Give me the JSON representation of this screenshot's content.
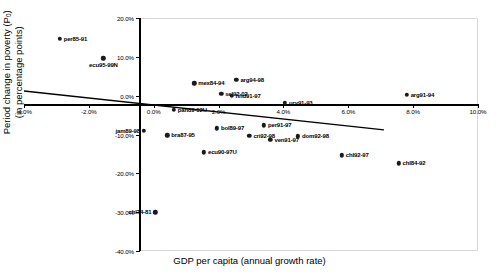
{
  "chart_data": {
    "type": "scatter",
    "title": "",
    "xlabel": "GDP per capita (annual growth rate)",
    "ylabel_line1": "Period change in poverty (P",
    "ylabel_sub": "0",
    "ylabel_line1_end": ")",
    "ylabel_line2": "(in percentage points)",
    "xlim": [
      -4.0,
      10.0
    ],
    "ylim": [
      -40.0,
      20.0
    ],
    "xticks": [
      "-4.0%",
      "-2.0%",
      "0.0%",
      "2.0%",
      "4.0%",
      "6.0%",
      "8.0%",
      "10.0%"
    ],
    "xtick_values": [
      -4.0,
      -2.0,
      0.0,
      2.0,
      4.0,
      6.0,
      8.0,
      10.0
    ],
    "yticks": [
      "20.0%",
      "10.0%",
      "0.0%",
      "-10.0%",
      "-20.0%",
      "-30.0%",
      "-40.0%"
    ],
    "ytick_values": [
      20.0,
      10.0,
      0.0,
      -10.0,
      -20.0,
      -30.0,
      -40.0
    ],
    "grid": false,
    "legend": "none",
    "trendline": {
      "label": "linear fit",
      "x0": -4.0,
      "y0": 1.2,
      "x1": 7.1,
      "y1": -8.8
    },
    "points": [
      {
        "label": "per85-91",
        "x": -2.9,
        "y": 14.6,
        "pos": "right"
      },
      {
        "label": "ecu95-99N",
        "x": -1.55,
        "y": 9.6,
        "pos": "below"
      },
      {
        "label": "mex84-94",
        "x": 1.25,
        "y": 3.2,
        "pos": "right"
      },
      {
        "label": "arg94-98",
        "x": 2.55,
        "y": 4.1,
        "pos": "right"
      },
      {
        "label": "arg91-94",
        "x": 7.8,
        "y": 0.3,
        "pos": "right"
      },
      {
        "label": "sel92-02",
        "x": 2.08,
        "y": 0.5,
        "pos": "right"
      },
      {
        "label": "hnd91-97",
        "x": 2.4,
        "y": 0.0,
        "pos": "right"
      },
      {
        "label": "ury91-93",
        "x": 4.05,
        "y": -1.8,
        "pos": "right"
      },
      {
        "label": "pan89-02U",
        "x": 0.62,
        "y": -3.6,
        "pos": "right"
      },
      {
        "label": "jam89-98",
        "x": -0.3,
        "y": -9.0,
        "pos": "left"
      },
      {
        "label": "bra87-95",
        "x": 0.42,
        "y": -10.2,
        "pos": "right"
      },
      {
        "label": "bol89-97",
        "x": 1.95,
        "y": -8.4,
        "pos": "right"
      },
      {
        "label": "cri92-98",
        "x": 2.95,
        "y": -10.3,
        "pos": "right"
      },
      {
        "label": "per91-97",
        "x": 3.4,
        "y": -7.6,
        "pos": "right"
      },
      {
        "label": "ven91-97",
        "x": 3.6,
        "y": -11.4,
        "pos": "right"
      },
      {
        "label": "dom92-98",
        "x": 4.45,
        "y": -10.5,
        "pos": "right"
      },
      {
        "label": "ecu90-97U",
        "x": 1.55,
        "y": -14.6,
        "pos": "right"
      },
      {
        "label": "chl92-97",
        "x": 5.8,
        "y": -15.4,
        "pos": "right"
      },
      {
        "label": "chl84-92",
        "x": 7.55,
        "y": -17.4,
        "pos": "right"
      },
      {
        "label": "chl74-81",
        "x": 0.05,
        "y": -30.0,
        "pos": "left"
      }
    ]
  }
}
